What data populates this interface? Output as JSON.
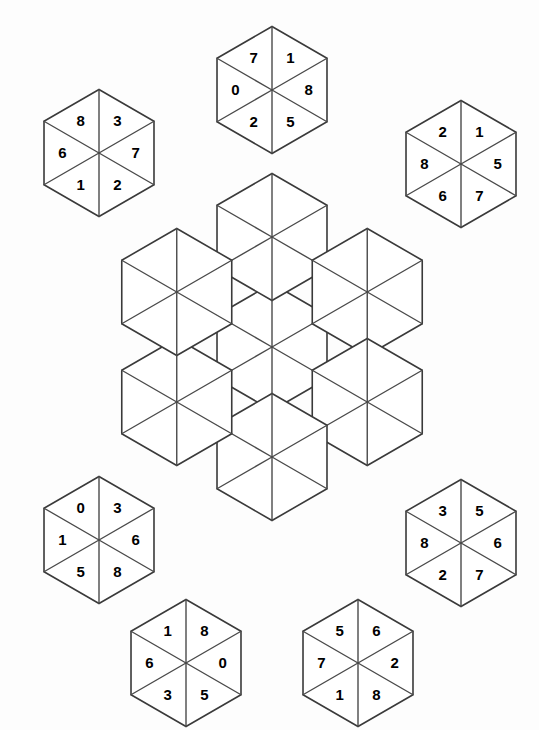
{
  "puzzle": {
    "type": "hexagon-tile-placement-puzzle",
    "background_color": "#fdfdfd",
    "line_color": "#3a3a3a",
    "digit_color": "#000000",
    "piece_count": 7,
    "digits_per_piece": 6,
    "board": {
      "name": "central-board",
      "description": "empty hexagonal flower board of 7 hexagons (42 triangular cells)",
      "hex_count": 7,
      "triangle_count": 42,
      "center_x": 272,
      "center_y": 347,
      "edge_length": 63.5,
      "hex_offsets": [
        [
          0,
          0
        ],
        [
          0,
          -2
        ],
        [
          1.5,
          -1
        ],
        [
          1.5,
          1
        ],
        [
          0,
          2
        ],
        [
          -1.5,
          1
        ],
        [
          -1.5,
          -1
        ]
      ]
    },
    "pieces": [
      {
        "id": "piece-top",
        "label": "top-piece",
        "cx": 272,
        "cy": 90,
        "digits": {
          "top": "1",
          "upper_right": "8",
          "lower_right": "5",
          "bottom": "2",
          "lower_left": "0",
          "upper_left": "7"
        },
        "digit_list": [
          "1",
          "8",
          "5",
          "2",
          "0",
          "7"
        ]
      },
      {
        "id": "piece-upper-left",
        "label": "upper-left-piece",
        "cx": 99,
        "cy": 153,
        "digits": {
          "top": "3",
          "upper_right": "7",
          "lower_right": "2",
          "bottom": "1",
          "lower_left": "6",
          "upper_left": "8"
        },
        "digit_list": [
          "3",
          "7",
          "2",
          "1",
          "6",
          "8"
        ]
      },
      {
        "id": "piece-upper-right",
        "label": "upper-right-piece",
        "cx": 461,
        "cy": 164,
        "digits": {
          "top": "1",
          "upper_right": "5",
          "lower_right": "7",
          "bottom": "6",
          "lower_left": "8",
          "upper_left": "2"
        },
        "digit_list": [
          "1",
          "5",
          "7",
          "6",
          "8",
          "2"
        ]
      },
      {
        "id": "piece-lower-left",
        "label": "lower-left-piece",
        "cx": 99,
        "cy": 540,
        "digits": {
          "top": "3",
          "upper_right": "6",
          "lower_right": "8",
          "bottom": "5",
          "lower_left": "1",
          "upper_left": "0"
        },
        "digit_list": [
          "3",
          "6",
          "8",
          "5",
          "1",
          "0"
        ]
      },
      {
        "id": "piece-lower-right",
        "label": "lower-right-piece",
        "cx": 461,
        "cy": 543,
        "digits": {
          "top": "5",
          "upper_right": "6",
          "lower_right": "7",
          "bottom": "2",
          "lower_left": "8",
          "upper_left": "3"
        },
        "digit_list": [
          "5",
          "6",
          "7",
          "2",
          "8",
          "3"
        ]
      },
      {
        "id": "piece-bottom-left",
        "label": "bottom-left-piece",
        "cx": 186,
        "cy": 663,
        "digits": {
          "top": "8",
          "upper_right": "0",
          "lower_right": "5",
          "bottom": "3",
          "lower_left": "6",
          "upper_left": "1"
        },
        "digit_list": [
          "8",
          "0",
          "5",
          "3",
          "6",
          "1"
        ]
      },
      {
        "id": "piece-bottom-right",
        "label": "bottom-right-piece",
        "cx": 358,
        "cy": 663,
        "digits": {
          "top": "6",
          "upper_right": "2",
          "lower_right": "8",
          "bottom": "1",
          "lower_left": "7",
          "upper_left": "5"
        },
        "digit_list": [
          "6",
          "2",
          "8",
          "1",
          "7",
          "5"
        ]
      }
    ]
  }
}
